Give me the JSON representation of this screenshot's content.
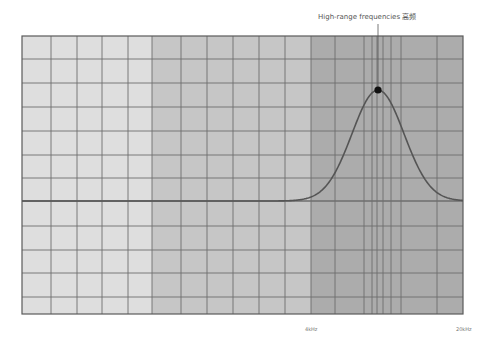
{
  "chart_data": {
    "type": "line",
    "title": "",
    "xlabel": "",
    "ylabel": "",
    "x_scale": "frequency",
    "x_tick_labels": [
      {
        "label": "4kHz",
        "x_px": 311
      },
      {
        "label": "20kHz",
        "x_px": 463
      }
    ],
    "zones": [
      {
        "name": "low-range",
        "x_start_px": 22,
        "x_end_px": 152,
        "color": "#dedede"
      },
      {
        "name": "mid-range",
        "x_start_px": 152,
        "x_end_px": 311,
        "color": "#c6c6c6"
      },
      {
        "name": "high-range",
        "x_start_px": 311,
        "x_end_px": 463,
        "color": "#acacac"
      }
    ],
    "series": [
      {
        "name": "response curve",
        "shape": "gaussian-bump",
        "baseline_y_px": 201,
        "peak": {
          "x_px": 378,
          "y_px": 90
        },
        "spread_px": 26,
        "color": "#555555"
      }
    ],
    "annotations": [
      {
        "text": "High-range frequencies 高频",
        "target_x_px": 378,
        "target_y_px": 90,
        "marker": "dot"
      }
    ],
    "grid": true,
    "plot_area": {
      "left": 22,
      "top": 36,
      "right": 463,
      "bottom": 314
    },
    "grid_x_px": [
      51,
      77,
      102,
      128,
      152,
      181,
      207,
      233,
      259,
      285,
      311,
      335,
      364,
      372,
      377,
      383,
      391,
      401,
      437
    ],
    "grid_y_px": [
      59,
      83,
      107,
      131,
      155,
      178,
      201,
      226,
      250,
      273,
      297
    ],
    "legend": null
  },
  "annotation_label": "High-range frequencies 高频",
  "ticks": {
    "t4k": "4kHz",
    "t20k": "20kHz"
  }
}
